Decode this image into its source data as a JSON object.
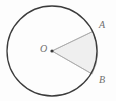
{
  "figure": {
    "kind": "circle-with-sector-diagram",
    "caption": "",
    "width": 116,
    "height": 101,
    "background_color": "#fdfdfd"
  },
  "labels": {
    "center": "O",
    "point_a": "A",
    "point_b": "B"
  },
  "geometry": {
    "circle": {
      "center_x": 52,
      "center_y": 51,
      "radius": 45,
      "stroke_color": "#3b3b3b",
      "stroke_width": 1.3,
      "fill": "none"
    },
    "center_dot": {
      "x": 52,
      "y": 51,
      "radius": 1.6,
      "color": "#3b3b3b"
    },
    "sector": {
      "name": "sector-OAB",
      "apex_x": 52,
      "apex_y": 51,
      "point_a_x": 92.6,
      "point_a_y": 31.5,
      "point_b_x": 92.1,
      "point_b_y": 74.0,
      "fill_color": "#efefef",
      "stroke_color": "#a9a9a9",
      "stroke_width": 0.8
    },
    "radius_oa": {
      "from_x": 52,
      "from_y": 51,
      "to_x": 92.6,
      "to_y": 31.5,
      "stroke_color": "#a9a9a9"
    },
    "radius_ob": {
      "from_x": 52,
      "from_y": 51,
      "to_x": 92.1,
      "to_y": 74.0,
      "stroke_color": "#a9a9a9"
    }
  },
  "colors": {
    "outline": "#3b3b3b",
    "sector_fill": "#efefef",
    "sector_edge": "#a9a9a9",
    "label_text": "#6f6f6f",
    "background": "#fdfdfd"
  }
}
